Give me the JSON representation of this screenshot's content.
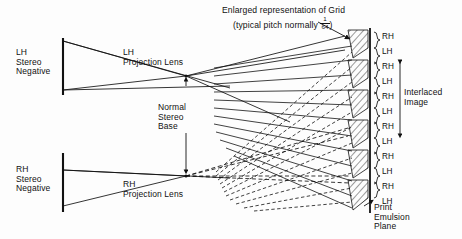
{
  "figure": {
    "title_caption": {
      "line1": "Enlarged representation of Grid",
      "line2_prefix": "(typical pitch normally ",
      "fraction_numerator": "1",
      "fraction_denominator": "64",
      "line2_suffix": ")"
    },
    "colors": {
      "ink": "#111111",
      "background": "#fdfdfd",
      "hatch": "#222222"
    },
    "left_diagram": {
      "lh_negative_label": "LH\nStereo\nNegative",
      "lh_lens_label": "LH\nProjection Lens",
      "rh_negative_label": "RH\nStereo\nNegative",
      "rh_lens_label": "RH\nProjection Lens",
      "stereo_base_label": "Normal\nStereo\nBase"
    },
    "right_diagram": {
      "interlaced_label": "Interlaced\nImage",
      "print_plane_label": "Print\nEmulsion\nPlane",
      "pair_labels": [
        {
          "rh": "RH",
          "lh": "LH"
        },
        {
          "rh": "RH",
          "lh": "LH"
        },
        {
          "rh": "RH",
          "lh": "LH"
        },
        {
          "rh": "RH",
          "lh": "LH"
        },
        {
          "rh": "RH",
          "lh": "LH"
        },
        {
          "rh": "RH",
          "lh": "LH"
        }
      ]
    }
  }
}
